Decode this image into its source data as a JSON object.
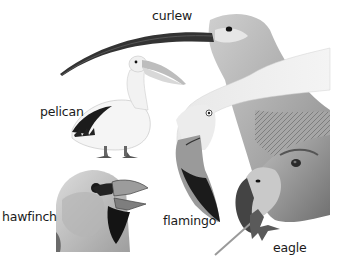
{
  "illustration": {
    "subject": "bird beak comparison",
    "colors": {
      "background": "#ffffff",
      "label": "#1a1a1a",
      "dark": "#1e1e1e",
      "mid": "#8a8a8a",
      "light": "#d6d6d6"
    },
    "labels": {
      "curlew": "curlew",
      "pelican": "pelican",
      "hawfinch": "hawfinch",
      "flamingo": "flamingo",
      "eagle": "eagle"
    }
  }
}
